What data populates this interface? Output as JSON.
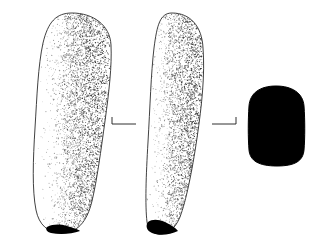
{
  "figure": {
    "title": "Ground stone celt illustration",
    "caption": "",
    "background_color": "#ffffff",
    "ink_color": "#1a1a1a",
    "fill_color": "#000000",
    "width": 325,
    "height": 250
  },
  "views": [
    {
      "id": "view-face",
      "label": "Face view",
      "outline_color": "#2b2b2b",
      "interior_fill": "#ffffff",
      "stipple_color": "#262626",
      "bbox": [
        30,
        13,
        82,
        221
      ],
      "outline_path": "M 72 13 C 93 13 110 25 111 45 C 112 66 109 92 105 121 C 101 150 97 180 92 201 C 87 222 77 233 62 233 C 48 233 39 225 36 210 C 32 190 33 160 35 128 C 37 96 38 66 43 43 C 48 22 56 13 72 13 Z",
      "dark_tip": {
        "description": "Chipped dark bit scar at the working edge",
        "path": "M 47 227 C 53 224 60 224 67 226 C 73 228 78 229 80 231 C 72 234 60 235 51 233 C 47 232 45 229 47 227 Z"
      }
    },
    {
      "id": "view-side",
      "label": "Side view",
      "outline_color": "#2b2b2b",
      "interior_fill": "#ffffff",
      "stipple_color": "#262626",
      "bbox": [
        140,
        13,
        66,
        222
      ],
      "outline_path": "M 172 13 C 190 13 202 26 203 48 C 205 74 202 104 197 138 C 192 172 186 201 180 217 C 175 229 168 234 160 234 C 153 234 148 230 147 222 C 145 205 146 176 148 142 C 150 108 151 73 154 48 C 157 25 160 13 172 13 Z",
      "dark_tip": {
        "description": "Blackened bevel at the tapered working end",
        "path": "M 148 222 C 152 219 158 219 165 222 C 171 225 176 228 178 231 C 170 235 159 236 152 233 C 147 231 145 226 148 222 Z"
      }
    },
    {
      "id": "view-cross-section",
      "label": "Cross section",
      "outline_color": "#000000",
      "interior_fill": "#000000",
      "stipple_color": "#000000",
      "bbox": [
        248,
        86,
        57,
        80
      ],
      "outline_path": "M 276 86 C 292 86 303 93 304 106 C 305 120 305 138 304 150 C 303 161 295 166 277 166 C 259 166 250 161 249 150 C 248 138 248 120 249 106 C 250 93 260 86 276 86 Z",
      "dark_tip": null
    }
  ],
  "section_markers": [
    {
      "id": "marker-left",
      "label": "Section indicator left",
      "orientation": "tick-left",
      "line": [
        112,
        124,
        136,
        124
      ],
      "tick": [
        112,
        117,
        112,
        124
      ]
    },
    {
      "id": "marker-right",
      "label": "Section indicator right",
      "orientation": "tick-right",
      "line": [
        212,
        124,
        236,
        124
      ],
      "tick": [
        236,
        117,
        236,
        124
      ]
    }
  ],
  "stipple": {
    "description": "Hand-drawn dot shading, sparse at left, dense toward right margin",
    "seed": 20240519,
    "dot_radius_min": 0.28,
    "dot_radius_max": 0.62
  }
}
